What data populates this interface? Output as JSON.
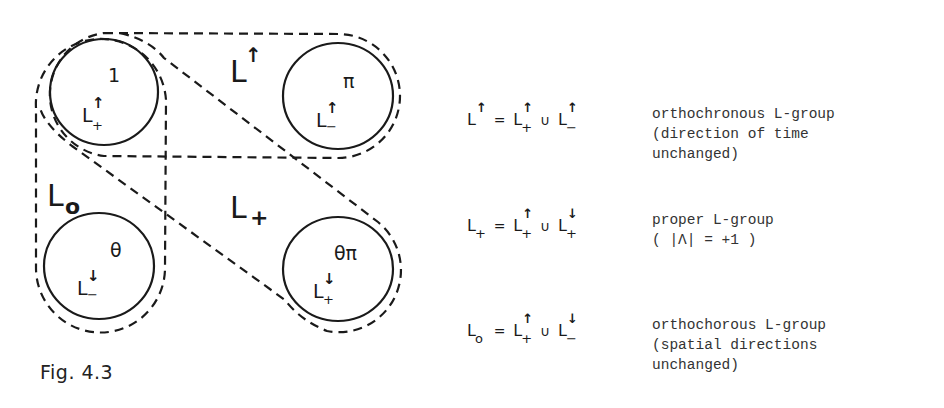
{
  "figure": {
    "caption": "Fig. 4.3",
    "colors": {
      "background": "#ffffff",
      "ink": "#1a1a1a"
    },
    "circles": [
      {
        "id": "identity",
        "element": "1",
        "component": "L",
        "time_arrow": "↑",
        "sign": "+",
        "cx": 104,
        "cy": 92
      },
      {
        "id": "parity",
        "element": "π",
        "component": "L",
        "time_arrow": "↑",
        "sign": "−",
        "cx": 338,
        "cy": 96
      },
      {
        "id": "time-reversal",
        "element": "θ",
        "component": "L",
        "time_arrow": "↓",
        "sign": "−",
        "cx": 99,
        "cy": 266
      },
      {
        "id": "full-reversal",
        "element": "θπ",
        "component": "L",
        "time_arrow": "↓",
        "sign": "+",
        "cx": 338,
        "cy": 269
      }
    ],
    "regions": [
      {
        "id": "orthochronous",
        "label": "L",
        "super": "↑",
        "sub": ""
      },
      {
        "id": "proper",
        "label": "L",
        "super": "",
        "sub": "+"
      },
      {
        "id": "orthochorous",
        "label": "L",
        "super": "",
        "sub": "o"
      }
    ]
  },
  "equations": [
    {
      "lhs": {
        "base": "L",
        "sup": "↑",
        "sub": ""
      },
      "equals": "=",
      "term1": {
        "base": "L",
        "sup": "↑",
        "sub": "+"
      },
      "union": "∪",
      "term2": {
        "base": "L",
        "sup": "↑",
        "sub": "−"
      },
      "description": "orthochronous L-group\n(direction of time\nunchanged)"
    },
    {
      "lhs": {
        "base": "L",
        "sup": "",
        "sub": "+"
      },
      "equals": "=",
      "term1": {
        "base": "L",
        "sup": "↑",
        "sub": "+"
      },
      "union": "∪",
      "term2": {
        "base": "L",
        "sup": "↓",
        "sub": "+"
      },
      "description": "proper L-group\n( |Λ| = +1 )"
    },
    {
      "lhs": {
        "base": "L",
        "sup": "",
        "sub": "o"
      },
      "equals": "=",
      "term1": {
        "base": "L",
        "sup": "↑",
        "sub": "+"
      },
      "union": "∪",
      "term2": {
        "base": "L",
        "sup": "↓",
        "sub": "−"
      },
      "description": "orthochorous L-group\n(spatial directions\nunchanged)"
    }
  ]
}
